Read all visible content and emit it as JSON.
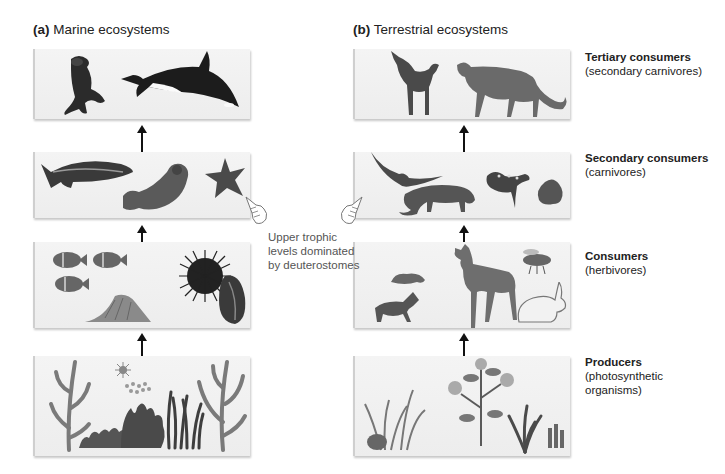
{
  "columns": [
    {
      "letter": "(a)",
      "title": "Marine ecosystems"
    },
    {
      "letter": "(b)",
      "title": "Terrestrial ecosystems"
    }
  ],
  "levels": [
    {
      "title": "Tertiary consumers",
      "subtitle": "(secondary carnivores)"
    },
    {
      "title": "Secondary consumers",
      "subtitle": "(carnivores)"
    },
    {
      "title": "Consumers",
      "subtitle": "(herbivores)"
    },
    {
      "title": "Producers",
      "subtitle": "(photosynthetic",
      "subtitle2": "organisms)"
    }
  ],
  "annotation": {
    "line1": "Upper trophic",
    "line2": "levels dominated",
    "line3": "by deuterostomes"
  },
  "marine_panels": [
    {
      "organisms": [
        "sea lion",
        "orca"
      ]
    },
    {
      "organisms": [
        "trout",
        "sea otter",
        "sea star"
      ]
    },
    {
      "organisms": [
        "reef fish",
        "sea slug",
        "sea urchin",
        "mussel"
      ]
    },
    {
      "organisms": [
        "kelp",
        "plankton",
        "seaweed",
        "algae"
      ]
    }
  ],
  "terrestrial_panels": [
    {
      "organisms": [
        "wolf",
        "cougar"
      ]
    },
    {
      "organisms": [
        "hawk",
        "weasel",
        "salamander",
        "frog"
      ]
    },
    {
      "organisms": [
        "grasshopper",
        "caterpillar",
        "deer",
        "bee",
        "rabbit"
      ]
    },
    {
      "organisms": [
        "shrubs",
        "grasses",
        "flowering plants",
        "moss"
      ]
    }
  ],
  "colors": {
    "panel": "#f0f0f0",
    "arrow": "#111111",
    "text": "#222222",
    "note": "#555555"
  }
}
